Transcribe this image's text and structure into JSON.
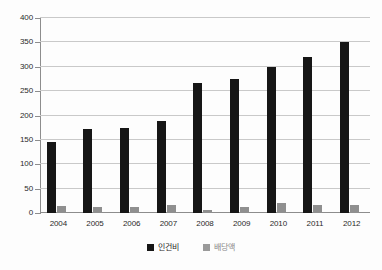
{
  "chart_data": {
    "type": "bar",
    "title": "",
    "xlabel": "",
    "ylabel": "",
    "ylim": [
      0,
      400
    ],
    "yticks": [
      0,
      50,
      100,
      150,
      200,
      250,
      300,
      350,
      400
    ],
    "ytick_labels": [
      "0",
      "50",
      "100",
      "150",
      "200",
      "250",
      "300",
      "350",
      "400"
    ],
    "grid": true,
    "legend_position": "bottom-center",
    "categories": [
      "2004",
      "2005",
      "2006",
      "2007",
      "2008",
      "2009",
      "2010",
      "2011",
      "2012"
    ],
    "series": [
      {
        "name": "인건비",
        "color": "#161616",
        "values": [
          146,
          172,
          174,
          188,
          266,
          274,
          300,
          321,
          350
        ]
      },
      {
        "name": "배당액",
        "color": "#8f8f8f",
        "values": [
          14,
          13,
          13,
          17,
          7,
          13,
          21,
          17,
          16
        ]
      }
    ]
  },
  "legend": {
    "items": [
      {
        "label": "인건비",
        "color": "#161616"
      },
      {
        "label": "배당액",
        "color": "#9a9a9a"
      }
    ]
  },
  "axis": {
    "line_color": "#8d8d8d",
    "grid_color": "#c9c9c9"
  }
}
